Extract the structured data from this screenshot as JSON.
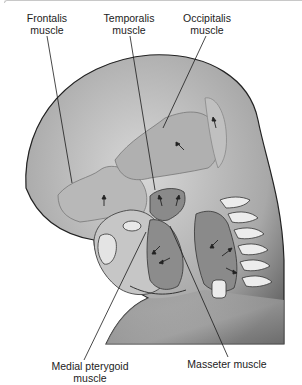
{
  "figure": {
    "colors": {
      "background": "#ffffff",
      "skin_light": "#d4d4d4",
      "skin_dark": "#6e6e6e",
      "muscle_light": "#b5b5b5",
      "muscle_dark": "#7d7d7d",
      "outline": "#2a2a2a",
      "bone": "#e6e6e6",
      "leader_line": "#1a1a1a"
    },
    "labels": [
      {
        "id": "frontalis",
        "text": "Frontalis\nmuscle"
      },
      {
        "id": "temporalis",
        "text": "Temporalis\nmuscle"
      },
      {
        "id": "occipitalis",
        "text": "Occipitalis\nmuscle"
      },
      {
        "id": "medial-pterygoid",
        "text": "Medial pterygoid\nmuscle"
      },
      {
        "id": "masseter",
        "text": "Masseter muscle"
      }
    ]
  }
}
